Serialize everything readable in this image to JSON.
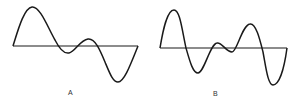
{
  "figure": {
    "panels": [
      {
        "label": "A",
        "description": "Waveform with one large positive peak, small dip, small bump, and large negative trough"
      },
      {
        "label": "B",
        "description": "Waveform with positive peak, negative trough, small bump and dip, positive peak, negative trough"
      }
    ]
  },
  "colors": {
    "line": "#1a1a1a",
    "background": "#ffffff"
  }
}
